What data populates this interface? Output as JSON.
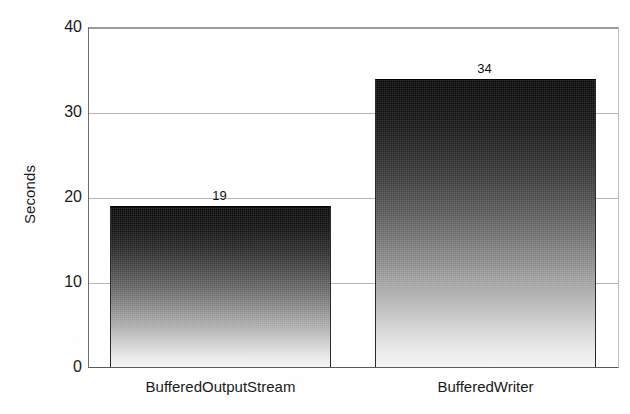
{
  "chart_data": {
    "type": "bar",
    "title": "",
    "subtitle": "",
    "xlabel": "",
    "ylabel": "Seconds",
    "categories": [
      "BufferedOutputStream",
      "BufferedWriter"
    ],
    "values": [
      19,
      34
    ],
    "value_labels": [
      "19",
      "34"
    ],
    "ylim": [
      0,
      40
    ],
    "y_ticks": [
      0,
      10,
      20,
      30,
      40
    ],
    "y_tick_labels": [
      "0",
      "10",
      "20",
      "30",
      "40"
    ],
    "grid": true,
    "grid_axis": "y",
    "legend": null,
    "legend_position": "none",
    "bar_style": "vertical-gradient-grayscale",
    "colors": {
      "bar_top": "#060606",
      "bar_bottom": "#f6f6f6",
      "gridline": "#b5b5b5",
      "axis": "#5a5a5a",
      "text": "#1a1a1a",
      "background": "#ffffff"
    }
  },
  "axis": {
    "y_title": "Seconds"
  }
}
